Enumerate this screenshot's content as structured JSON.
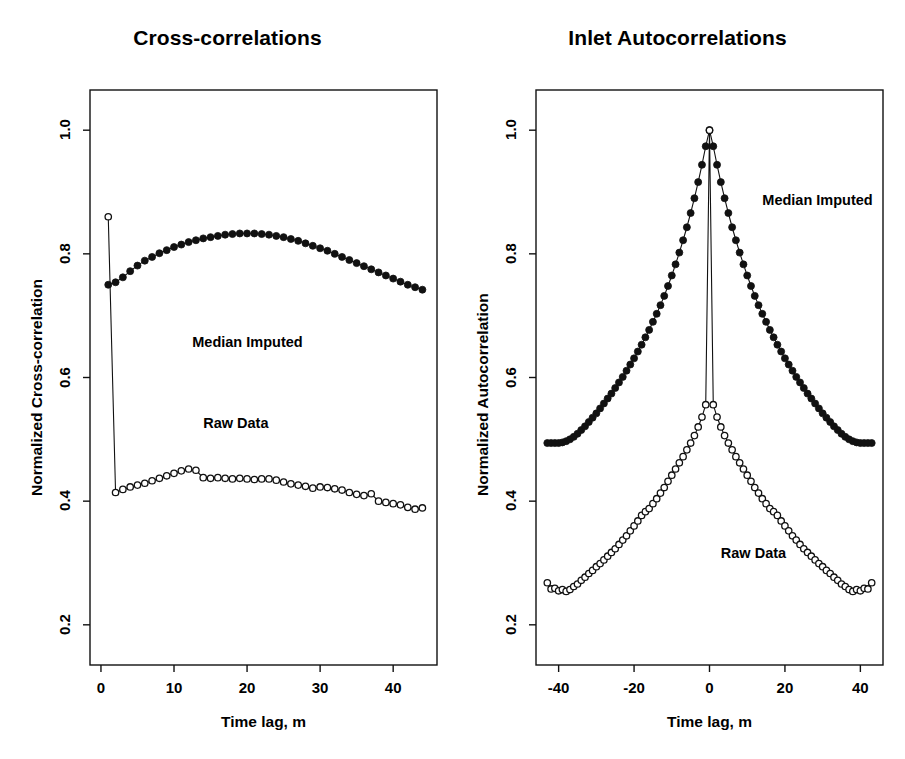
{
  "figure": {
    "background": "#ffffff",
    "foreground": "#111111"
  },
  "panels": [
    {
      "id": "cross-correlations",
      "title": "Cross-correlations",
      "xlabel": "Time lag, m",
      "ylabel": "Normalized Cross-correlation",
      "annotations": [
        {
          "text": "Median Imputed",
          "x": 12.5,
          "y": 0.655
        },
        {
          "text": "Raw Data",
          "x": 14.0,
          "y": 0.525
        }
      ]
    },
    {
      "id": "inlet-autocorrelations",
      "title": "Inlet Autocorrelations",
      "xlabel": "Time lag, m",
      "ylabel": "Normalized Autocorrelation",
      "annotations": [
        {
          "text": "Median Imputed",
          "x": 14.0,
          "y": 0.885
        },
        {
          "text": "Raw Data",
          "x": 3.0,
          "y": 0.315
        }
      ]
    }
  ],
  "chart_data": [
    {
      "type": "line",
      "id": "cross-correlations",
      "title": "Cross-correlations",
      "xlabel": "Time lag, m",
      "ylabel": "Normalized Cross-correlation",
      "xlim": [
        -1.5,
        46
      ],
      "ylim": [
        0.135,
        1.065
      ],
      "xticks": [
        0,
        10,
        20,
        30,
        40
      ],
      "xticklabels": [
        "0",
        "10",
        "20",
        "30",
        "40"
      ],
      "yticks": [
        0.2,
        0.4,
        0.6,
        0.8,
        1.0
      ],
      "yticklabels": [
        "0.2",
        "0.4",
        "0.6",
        "0.8",
        "1.0"
      ],
      "grid": false,
      "legend_position": "inside-annotations",
      "series": [
        {
          "name": "Median Imputed",
          "marker": "filled-circle",
          "x": [
            1,
            2,
            3,
            4,
            5,
            6,
            7,
            8,
            9,
            10,
            11,
            12,
            13,
            14,
            15,
            16,
            17,
            18,
            19,
            20,
            21,
            22,
            23,
            24,
            25,
            26,
            27,
            28,
            29,
            30,
            31,
            32,
            33,
            34,
            35,
            36,
            37,
            38,
            39,
            40,
            41,
            42,
            43,
            44
          ],
          "y": [
            0.75,
            0.754,
            0.762,
            0.772,
            0.781,
            0.789,
            0.795,
            0.801,
            0.806,
            0.811,
            0.815,
            0.819,
            0.822,
            0.825,
            0.827,
            0.829,
            0.831,
            0.832,
            0.833,
            0.833,
            0.833,
            0.832,
            0.831,
            0.829,
            0.827,
            0.824,
            0.821,
            0.817,
            0.813,
            0.809,
            0.805,
            0.8,
            0.795,
            0.79,
            0.785,
            0.78,
            0.775,
            0.77,
            0.765,
            0.76,
            0.755,
            0.75,
            0.746,
            0.742
          ]
        },
        {
          "name": "Raw Data",
          "marker": "open-circle",
          "x": [
            1,
            2,
            3,
            4,
            5,
            6,
            7,
            8,
            9,
            10,
            11,
            12,
            13,
            14,
            15,
            16,
            17,
            18,
            19,
            20,
            21,
            22,
            23,
            24,
            25,
            26,
            27,
            28,
            29,
            30,
            31,
            32,
            33,
            34,
            35,
            36,
            37,
            38,
            39,
            40,
            41,
            42,
            43,
            44
          ],
          "y": [
            0.86,
            0.414,
            0.419,
            0.423,
            0.426,
            0.429,
            0.433,
            0.437,
            0.441,
            0.445,
            0.449,
            0.452,
            0.45,
            0.438,
            0.437,
            0.438,
            0.437,
            0.436,
            0.437,
            0.436,
            0.435,
            0.436,
            0.436,
            0.434,
            0.431,
            0.428,
            0.426,
            0.424,
            0.421,
            0.423,
            0.422,
            0.42,
            0.418,
            0.414,
            0.411,
            0.409,
            0.412,
            0.4,
            0.398,
            0.396,
            0.394,
            0.39,
            0.387,
            0.389
          ]
        }
      ]
    },
    {
      "type": "line",
      "id": "inlet-autocorrelations",
      "title": "Inlet Autocorrelations",
      "xlabel": "Time lag, m",
      "ylabel": "Normalized Autocorrelation",
      "xlim": [
        -46,
        46
      ],
      "ylim": [
        0.135,
        1.065
      ],
      "xticks": [
        -40,
        -20,
        0,
        20,
        40
      ],
      "xticklabels": [
        "-40",
        "-20",
        "0",
        "20",
        "40"
      ],
      "yticks": [
        0.2,
        0.4,
        0.6,
        0.8,
        1.0
      ],
      "yticklabels": [
        "0.2",
        "0.4",
        "0.6",
        "0.8",
        "1.0"
      ],
      "grid": false,
      "legend_position": "inside-annotations",
      "series": [
        {
          "name": "Median Imputed",
          "marker": "filled-circle",
          "x": [
            -43,
            -42,
            -41,
            -40,
            -39,
            -38,
            -37,
            -36,
            -35,
            -34,
            -33,
            -32,
            -31,
            -30,
            -29,
            -28,
            -27,
            -26,
            -25,
            -24,
            -23,
            -22,
            -21,
            -20,
            -19,
            -18,
            -17,
            -16,
            -15,
            -14,
            -13,
            -12,
            -11,
            -10,
            -9,
            -8,
            -7,
            -6,
            -5,
            -4,
            -3,
            -2,
            -1,
            0,
            1,
            2,
            3,
            4,
            5,
            6,
            7,
            8,
            9,
            10,
            11,
            12,
            13,
            14,
            15,
            16,
            17,
            18,
            19,
            20,
            21,
            22,
            23,
            24,
            25,
            26,
            27,
            28,
            29,
            30,
            31,
            32,
            33,
            34,
            35,
            36,
            37,
            38,
            39,
            40,
            41,
            42,
            43
          ],
          "y": [
            0.494,
            0.494,
            0.494,
            0.494,
            0.495,
            0.497,
            0.5,
            0.504,
            0.509,
            0.515,
            0.521,
            0.528,
            0.535,
            0.542,
            0.55,
            0.558,
            0.566,
            0.574,
            0.583,
            0.592,
            0.601,
            0.611,
            0.621,
            0.631,
            0.642,
            0.653,
            0.665,
            0.677,
            0.69,
            0.703,
            0.717,
            0.732,
            0.748,
            0.765,
            0.783,
            0.802,
            0.822,
            0.843,
            0.866,
            0.89,
            0.916,
            0.944,
            0.974,
            1.0,
            0.974,
            0.944,
            0.916,
            0.89,
            0.866,
            0.843,
            0.822,
            0.802,
            0.783,
            0.765,
            0.748,
            0.732,
            0.717,
            0.703,
            0.69,
            0.677,
            0.665,
            0.653,
            0.642,
            0.631,
            0.621,
            0.611,
            0.601,
            0.592,
            0.583,
            0.574,
            0.566,
            0.558,
            0.55,
            0.542,
            0.535,
            0.528,
            0.521,
            0.515,
            0.509,
            0.504,
            0.5,
            0.497,
            0.495,
            0.494,
            0.494,
            0.494,
            0.494
          ]
        },
        {
          "name": "Raw Data",
          "marker": "open-circle",
          "x": [
            -43,
            -42,
            -41,
            -40,
            -39,
            -38,
            -37,
            -36,
            -35,
            -34,
            -33,
            -32,
            -31,
            -30,
            -29,
            -28,
            -27,
            -26,
            -25,
            -24,
            -23,
            -22,
            -21,
            -20,
            -19,
            -18,
            -17,
            -16,
            -15,
            -14,
            -13,
            -12,
            -11,
            -10,
            -9,
            -8,
            -7,
            -6,
            -5,
            -4,
            -3,
            -2,
            -1,
            0,
            1,
            2,
            3,
            4,
            5,
            6,
            7,
            8,
            9,
            10,
            11,
            12,
            13,
            14,
            15,
            16,
            17,
            18,
            19,
            20,
            21,
            22,
            23,
            24,
            25,
            26,
            27,
            28,
            29,
            30,
            31,
            32,
            33,
            34,
            35,
            36,
            37,
            38,
            39,
            40,
            41,
            42,
            43
          ],
          "y": [
            0.268,
            0.258,
            0.259,
            0.255,
            0.257,
            0.254,
            0.257,
            0.262,
            0.266,
            0.272,
            0.277,
            0.283,
            0.288,
            0.294,
            0.299,
            0.305,
            0.311,
            0.317,
            0.323,
            0.33,
            0.337,
            0.344,
            0.352,
            0.36,
            0.368,
            0.377,
            0.383,
            0.388,
            0.396,
            0.404,
            0.413,
            0.422,
            0.432,
            0.442,
            0.452,
            0.462,
            0.472,
            0.483,
            0.494,
            0.506,
            0.52,
            0.536,
            0.556,
            1.0,
            0.556,
            0.536,
            0.52,
            0.506,
            0.494,
            0.483,
            0.472,
            0.462,
            0.452,
            0.442,
            0.432,
            0.422,
            0.413,
            0.404,
            0.396,
            0.388,
            0.383,
            0.377,
            0.368,
            0.36,
            0.352,
            0.344,
            0.337,
            0.33,
            0.323,
            0.317,
            0.311,
            0.305,
            0.299,
            0.294,
            0.288,
            0.283,
            0.277,
            0.272,
            0.266,
            0.262,
            0.257,
            0.254,
            0.257,
            0.255,
            0.259,
            0.258,
            0.268
          ]
        }
      ]
    }
  ]
}
